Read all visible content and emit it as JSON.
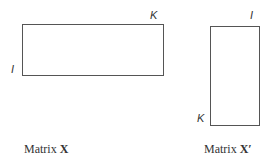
{
  "matrix_x": {
    "row_label": "I",
    "col_label": "K",
    "caption_prefix": "Matrix ",
    "caption_symbol": "X"
  },
  "matrix_x_transpose": {
    "row_label": "K",
    "col_label": "I",
    "caption_prefix": "Matrix ",
    "caption_symbol": "X′"
  }
}
